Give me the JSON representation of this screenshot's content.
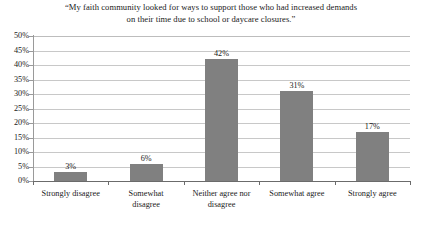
{
  "chart_data": {
    "type": "bar",
    "title": "“My faith community looked for ways to support those who had increased demands on their time due to school or daycare closures.”",
    "title_line1": "“My faith community looked for ways to support those who had increased demands",
    "title_line2": "on their time due to school or daycare closures.”",
    "categories": [
      "Strongly disagree",
      "Somewhat disagree",
      "Neither agree nor disagree",
      "Somewhat agree",
      "Strongly agree"
    ],
    "category_lines": [
      [
        "Strongly disagree"
      ],
      [
        "Somewhat",
        "disagree"
      ],
      [
        "Neither agree nor",
        "disagree"
      ],
      [
        "Somewhat agree"
      ],
      [
        "Strongly agree"
      ]
    ],
    "values": [
      3,
      6,
      42,
      31,
      17
    ],
    "data_labels": [
      "3%",
      "6%",
      "42%",
      "31%",
      "17%"
    ],
    "xlabel": "",
    "ylabel": "",
    "ylim": [
      0,
      50
    ],
    "ytick_step": 5,
    "ytick_labels": [
      "50%",
      "45%",
      "40%",
      "35%",
      "30%",
      "25%",
      "20%",
      "15%",
      "10%",
      "5%",
      "0%"
    ],
    "ytick_values": [
      50,
      45,
      40,
      35,
      30,
      25,
      20,
      15,
      10,
      5,
      0
    ],
    "grid": true,
    "legend": false,
    "series_color": "#808080",
    "gridline_color": "#c8c8c8",
    "axis_color": "#6b6b6b",
    "background_color": "#ffffff"
  }
}
